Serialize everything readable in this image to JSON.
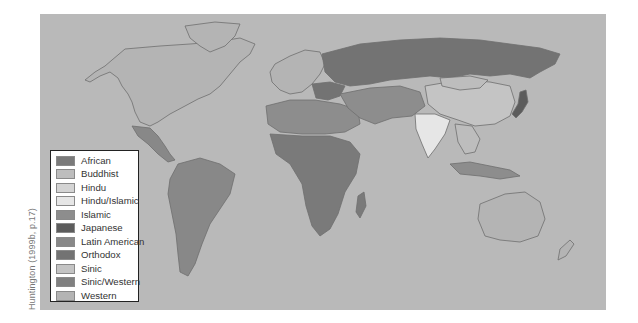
{
  "map": {
    "title": "Civilizations of the world",
    "source_caption": "Huntington (1999b, p.17)",
    "ocean_color": "#b9b9b9",
    "border_color": "#6f6f6f"
  },
  "legend": {
    "items": [
      {
        "label": "African",
        "color": "#7a7a7a"
      },
      {
        "label": "Buddhist",
        "color": "#bdbdbd"
      },
      {
        "label": "Hindu",
        "color": "#d4d4d4"
      },
      {
        "label": "Hindu/Islamic",
        "color": "#e6e6e6"
      },
      {
        "label": "Islamic",
        "color": "#8d8d8d"
      },
      {
        "label": "Japanese",
        "color": "#5c5c5c"
      },
      {
        "label": "Latin American",
        "color": "#888888"
      },
      {
        "label": "Orthodox",
        "color": "#737373"
      },
      {
        "label": "Sinic",
        "color": "#c4c4c4"
      },
      {
        "label": "Sinic/Western",
        "color": "#808080"
      },
      {
        "label": "Western",
        "color": "#b4b4b4"
      }
    ]
  }
}
